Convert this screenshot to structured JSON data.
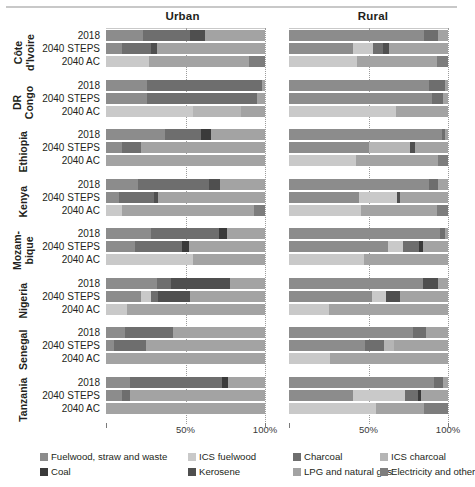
{
  "panels": [
    {
      "id": "urban",
      "title": "Urban"
    },
    {
      "id": "rural",
      "title": "Rural"
    }
  ],
  "axis": {
    "ticks": [
      {
        "label": "50%",
        "value": 50
      },
      {
        "label": "100%",
        "value": 100
      }
    ],
    "min": 0,
    "max": 100
  },
  "scenarios": [
    "2018",
    "2040 STEPS",
    "2040 AC"
  ],
  "countries": [
    {
      "name": "Côte\nd'Ivoire",
      "label_lines": [
        "Côte",
        "d'Ivoire"
      ]
    },
    {
      "name": "DR\nCongo",
      "label_lines": [
        "DR",
        "Congo"
      ]
    },
    {
      "name": "Ethiopia",
      "label_lines": [
        "Ethiopia"
      ]
    },
    {
      "name": "Kenya",
      "label_lines": [
        "Kenya"
      ]
    },
    {
      "name": "Mozam-\nbique",
      "label_lines": [
        "Mozam-",
        "bique"
      ]
    },
    {
      "name": "Nigeria",
      "label_lines": [
        "Nigeria"
      ]
    },
    {
      "name": "Senegal",
      "label_lines": [
        "Senegal"
      ]
    },
    {
      "name": "Tanzania",
      "label_lines": [
        "Tanzania"
      ]
    }
  ],
  "legend": {
    "items": [
      {
        "label": "Fuelwood, straw and waste",
        "color": "#8c8c8c",
        "key": "fuelwood"
      },
      {
        "label": "ICS fuelwood",
        "color": "#c9c9c9",
        "key": "ics_fuelwood"
      },
      {
        "label": "Charcoal",
        "color": "#6e6e6e",
        "key": "charcoal"
      },
      {
        "label": "ICS charcoal",
        "color": "#b5b5b5",
        "key": "ics_charcoal"
      },
      {
        "label": "Coal",
        "color": "#3a3a3a",
        "key": "coal"
      },
      {
        "label": "Kerosene",
        "color": "#4f4f4f",
        "key": "kerosene"
      },
      {
        "label": "LPG and natural gas",
        "color": "#a3a3a3",
        "key": "lpg"
      },
      {
        "label": "Electricity and other",
        "color": "#7d7d7d",
        "key": "electricity"
      }
    ]
  },
  "chart_data": {
    "type": "bar",
    "subtype": "stacked-horizontal-100pct",
    "title": "",
    "xlabel": "",
    "ylabel": "",
    "xlim": [
      0,
      100
    ],
    "grid": true,
    "legend_position": "bottom",
    "categories": [
      "Fuelwood, straw and waste",
      "ICS fuelwood",
      "Charcoal",
      "ICS charcoal",
      "Coal",
      "Kerosene",
      "LPG and natural gas",
      "Electricity and other"
    ],
    "panels": [
      "Urban",
      "Rural"
    ],
    "rows": [
      {
        "country": "Côte d'Ivoire",
        "scenario": "2018",
        "Urban": {
          "fuelwood": 23,
          "ics_fuelwood": 0,
          "charcoal": 30,
          "ics_charcoal": 0,
          "coal": 0,
          "kerosene": 9,
          "lpg": 38,
          "electricity": 0
        },
        "Rural": {
          "fuelwood": 85,
          "ics_fuelwood": 0,
          "charcoal": 9,
          "ics_charcoal": 0,
          "coal": 0,
          "kerosene": 0,
          "lpg": 6,
          "electricity": 0
        }
      },
      {
        "country": "Côte d'Ivoire",
        "scenario": "2040 STEPS",
        "Urban": {
          "fuelwood": 10,
          "ics_fuelwood": 0,
          "charcoal": 18,
          "ics_charcoal": 0,
          "coal": 0,
          "kerosene": 4,
          "lpg": 68,
          "electricity": 0
        },
        "Rural": {
          "fuelwood": 40,
          "ics_fuelwood": 13,
          "charcoal": 6,
          "ics_charcoal": 0,
          "coal": 0,
          "kerosene": 4,
          "lpg": 37,
          "electricity": 0
        }
      },
      {
        "country": "Côte d'Ivoire",
        "scenario": "2040 AC",
        "Urban": {
          "fuelwood": 0,
          "ics_fuelwood": 27,
          "charcoal": 0,
          "ics_charcoal": 0,
          "coal": 0,
          "kerosene": 0,
          "lpg": 63,
          "electricity": 10
        },
        "Rural": {
          "fuelwood": 0,
          "ics_fuelwood": 43,
          "charcoal": 0,
          "ics_charcoal": 0,
          "coal": 0,
          "kerosene": 0,
          "lpg": 50,
          "electricity": 7
        }
      },
      {
        "country": "DR Congo",
        "scenario": "2018",
        "Urban": {
          "fuelwood": 26,
          "ics_fuelwood": 0,
          "charcoal": 72,
          "ics_charcoal": 0,
          "coal": 0,
          "kerosene": 0,
          "lpg": 2,
          "electricity": 0
        },
        "Rural": {
          "fuelwood": 88,
          "ics_fuelwood": 0,
          "charcoal": 10,
          "ics_charcoal": 0,
          "coal": 0,
          "kerosene": 0,
          "lpg": 2,
          "electricity": 0
        }
      },
      {
        "country": "DR Congo",
        "scenario": "2040 STEPS",
        "Urban": {
          "fuelwood": 26,
          "ics_fuelwood": 0,
          "charcoal": 69,
          "ics_charcoal": 0,
          "coal": 0,
          "kerosene": 0,
          "lpg": 5,
          "electricity": 0
        },
        "Rural": {
          "fuelwood": 90,
          "ics_fuelwood": 0,
          "charcoal": 7,
          "ics_charcoal": 0,
          "coal": 0,
          "kerosene": 0,
          "lpg": 3,
          "electricity": 0
        }
      },
      {
        "country": "DR Congo",
        "scenario": "2040 AC",
        "Urban": {
          "fuelwood": 0,
          "ics_fuelwood": 55,
          "charcoal": 0,
          "ics_charcoal": 30,
          "coal": 0,
          "kerosene": 0,
          "lpg": 15,
          "electricity": 0
        },
        "Rural": {
          "fuelwood": 0,
          "ics_fuelwood": 67,
          "charcoal": 0,
          "ics_charcoal": 0,
          "coal": 0,
          "kerosene": 0,
          "lpg": 33,
          "electricity": 0
        }
      },
      {
        "country": "Ethiopia",
        "scenario": "2018",
        "Urban": {
          "fuelwood": 37,
          "ics_fuelwood": 0,
          "charcoal": 23,
          "ics_charcoal": 0,
          "coal": 6,
          "kerosene": 0,
          "lpg": 34,
          "electricity": 0
        },
        "Rural": {
          "fuelwood": 96,
          "ics_fuelwood": 0,
          "charcoal": 2,
          "ics_charcoal": 0,
          "coal": 0,
          "kerosene": 0,
          "lpg": 2,
          "electricity": 0
        }
      },
      {
        "country": "Ethiopia",
        "scenario": "2040 STEPS",
        "Urban": {
          "fuelwood": 10,
          "ics_fuelwood": 0,
          "charcoal": 12,
          "ics_charcoal": 0,
          "coal": 0,
          "kerosene": 0,
          "lpg": 78,
          "electricity": 0
        },
        "Rural": {
          "fuelwood": 50,
          "ics_fuelwood": 0,
          "charcoal": 0,
          "ics_charcoal": 26,
          "coal": 0,
          "kerosene": 3,
          "lpg": 21,
          "electricity": 0
        }
      },
      {
        "country": "Ethiopia",
        "scenario": "2040 AC",
        "Urban": {
          "fuelwood": 0,
          "ics_fuelwood": 0,
          "charcoal": 0,
          "ics_charcoal": 0,
          "coal": 0,
          "kerosene": 0,
          "lpg": 100,
          "electricity": 0
        },
        "Rural": {
          "fuelwood": 0,
          "ics_fuelwood": 42,
          "charcoal": 0,
          "ics_charcoal": 0,
          "coal": 0,
          "kerosene": 0,
          "lpg": 52,
          "electricity": 6
        }
      },
      {
        "country": "Kenya",
        "scenario": "2018",
        "Urban": {
          "fuelwood": 20,
          "ics_fuelwood": 0,
          "charcoal": 45,
          "ics_charcoal": 0,
          "coal": 0,
          "kerosene": 7,
          "lpg": 28,
          "electricity": 0
        },
        "Rural": {
          "fuelwood": 88,
          "ics_fuelwood": 0,
          "charcoal": 6,
          "ics_charcoal": 0,
          "coal": 0,
          "kerosene": 0,
          "lpg": 6,
          "electricity": 0
        }
      },
      {
        "country": "Kenya",
        "scenario": "2040 STEPS",
        "Urban": {
          "fuelwood": 8,
          "ics_fuelwood": 0,
          "charcoal": 22,
          "ics_charcoal": 0,
          "coal": 0,
          "kerosene": 3,
          "lpg": 67,
          "electricity": 0
        },
        "Rural": {
          "fuelwood": 44,
          "ics_fuelwood": 24,
          "charcoal": 0,
          "ics_charcoal": 0,
          "coal": 0,
          "kerosene": 2,
          "lpg": 30,
          "electricity": 0
        }
      },
      {
        "country": "Kenya",
        "scenario": "2040 AC",
        "Urban": {
          "fuelwood": 0,
          "ics_fuelwood": 10,
          "charcoal": 0,
          "ics_charcoal": 0,
          "coal": 0,
          "kerosene": 0,
          "lpg": 83,
          "electricity": 7
        },
        "Rural": {
          "fuelwood": 0,
          "ics_fuelwood": 45,
          "charcoal": 0,
          "ics_charcoal": 0,
          "coal": 0,
          "kerosene": 0,
          "lpg": 48,
          "electricity": 7
        }
      },
      {
        "country": "Mozambique",
        "scenario": "2018",
        "Urban": {
          "fuelwood": 28,
          "ics_fuelwood": 0,
          "charcoal": 43,
          "ics_charcoal": 0,
          "coal": 5,
          "kerosene": 0,
          "lpg": 24,
          "electricity": 0
        },
        "Rural": {
          "fuelwood": 95,
          "ics_fuelwood": 0,
          "charcoal": 3,
          "ics_charcoal": 0,
          "coal": 0,
          "kerosene": 0,
          "lpg": 2,
          "electricity": 0
        }
      },
      {
        "country": "Mozambique",
        "scenario": "2040 STEPS",
        "Urban": {
          "fuelwood": 18,
          "ics_fuelwood": 0,
          "charcoal": 30,
          "ics_charcoal": 0,
          "coal": 4,
          "kerosene": 0,
          "lpg": 48,
          "electricity": 0
        },
        "Rural": {
          "fuelwood": 62,
          "ics_fuelwood": 10,
          "charcoal": 10,
          "ics_charcoal": 0,
          "coal": 2,
          "kerosene": 0,
          "lpg": 16,
          "electricity": 0
        }
      },
      {
        "country": "Mozambique",
        "scenario": "2040 AC",
        "Urban": {
          "fuelwood": 0,
          "ics_fuelwood": 55,
          "charcoal": 0,
          "ics_charcoal": 0,
          "coal": 0,
          "kerosene": 0,
          "lpg": 45,
          "electricity": 0
        },
        "Rural": {
          "fuelwood": 0,
          "ics_fuelwood": 47,
          "charcoal": 0,
          "ics_charcoal": 0,
          "coal": 0,
          "kerosene": 0,
          "lpg": 53,
          "electricity": 0
        }
      },
      {
        "country": "Nigeria",
        "scenario": "2018",
        "Urban": {
          "fuelwood": 32,
          "ics_fuelwood": 0,
          "charcoal": 9,
          "ics_charcoal": 0,
          "coal": 0,
          "kerosene": 37,
          "lpg": 22,
          "electricity": 0
        },
        "Rural": {
          "fuelwood": 84,
          "ics_fuelwood": 0,
          "charcoal": 0,
          "ics_charcoal": 0,
          "coal": 0,
          "kerosene": 10,
          "lpg": 6,
          "electricity": 0
        }
      },
      {
        "country": "Nigeria",
        "scenario": "2040 STEPS",
        "Urban": {
          "fuelwood": 22,
          "ics_fuelwood": 6,
          "charcoal": 5,
          "ics_charcoal": 0,
          "coal": 0,
          "kerosene": 20,
          "lpg": 47,
          "electricity": 0
        },
        "Rural": {
          "fuelwood": 52,
          "ics_fuelwood": 9,
          "charcoal": 0,
          "ics_charcoal": 0,
          "coal": 0,
          "kerosene": 9,
          "lpg": 30,
          "electricity": 0
        }
      },
      {
        "country": "Nigeria",
        "scenario": "2040 AC",
        "Urban": {
          "fuelwood": 0,
          "ics_fuelwood": 13,
          "charcoal": 0,
          "ics_charcoal": 0,
          "coal": 0,
          "kerosene": 0,
          "lpg": 87,
          "electricity": 0
        },
        "Rural": {
          "fuelwood": 0,
          "ics_fuelwood": 25,
          "charcoal": 0,
          "ics_charcoal": 0,
          "coal": 0,
          "kerosene": 0,
          "lpg": 75,
          "electricity": 0
        }
      },
      {
        "country": "Senegal",
        "scenario": "2018",
        "Urban": {
          "fuelwood": 12,
          "ics_fuelwood": 0,
          "charcoal": 30,
          "ics_charcoal": 0,
          "coal": 0,
          "kerosene": 0,
          "lpg": 58,
          "electricity": 0
        },
        "Rural": {
          "fuelwood": 78,
          "ics_fuelwood": 0,
          "charcoal": 8,
          "ics_charcoal": 0,
          "coal": 0,
          "kerosene": 0,
          "lpg": 14,
          "electricity": 0
        }
      },
      {
        "country": "Senegal",
        "scenario": "2040 STEPS",
        "Urban": {
          "fuelwood": 5,
          "ics_fuelwood": 0,
          "charcoal": 20,
          "ics_charcoal": 0,
          "coal": 0,
          "kerosene": 0,
          "lpg": 75,
          "electricity": 0
        },
        "Rural": {
          "fuelwood": 48,
          "ics_fuelwood": 0,
          "charcoal": 12,
          "ics_charcoal": 6,
          "coal": 0,
          "kerosene": 0,
          "lpg": 34,
          "electricity": 0
        }
      },
      {
        "country": "Senegal",
        "scenario": "2040 AC",
        "Urban": {
          "fuelwood": 0,
          "ics_fuelwood": 0,
          "charcoal": 0,
          "ics_charcoal": 0,
          "coal": 0,
          "kerosene": 0,
          "lpg": 100,
          "electricity": 0
        },
        "Rural": {
          "fuelwood": 0,
          "ics_fuelwood": 26,
          "charcoal": 0,
          "ics_charcoal": 0,
          "coal": 0,
          "kerosene": 0,
          "lpg": 74,
          "electricity": 0
        }
      },
      {
        "country": "Tanzania",
        "scenario": "2018",
        "Urban": {
          "fuelwood": 15,
          "ics_fuelwood": 0,
          "charcoal": 58,
          "ics_charcoal": 0,
          "coal": 4,
          "kerosene": 0,
          "lpg": 23,
          "electricity": 0
        },
        "Rural": {
          "fuelwood": 91,
          "ics_fuelwood": 0,
          "charcoal": 6,
          "ics_charcoal": 0,
          "coal": 0,
          "kerosene": 0,
          "lpg": 3,
          "electricity": 0
        }
      },
      {
        "country": "Tanzania",
        "scenario": "2040 STEPS",
        "Urban": {
          "fuelwood": 10,
          "ics_fuelwood": 0,
          "charcoal": 5,
          "ics_charcoal": 0,
          "coal": 0,
          "kerosene": 0,
          "lpg": 85,
          "electricity": 0
        },
        "Rural": {
          "fuelwood": 40,
          "ics_fuelwood": 33,
          "charcoal": 8,
          "ics_charcoal": 0,
          "coal": 2,
          "kerosene": 0,
          "lpg": 17,
          "electricity": 0
        }
      },
      {
        "country": "Tanzania",
        "scenario": "2040 AC",
        "Urban": {
          "fuelwood": 0,
          "ics_fuelwood": 0,
          "charcoal": 0,
          "ics_charcoal": 0,
          "coal": 0,
          "kerosene": 0,
          "lpg": 100,
          "electricity": 0
        },
        "Rural": {
          "fuelwood": 0,
          "ics_fuelwood": 55,
          "charcoal": 0,
          "ics_charcoal": 0,
          "coal": 0,
          "kerosene": 0,
          "lpg": 30,
          "electricity": 15
        }
      }
    ]
  }
}
